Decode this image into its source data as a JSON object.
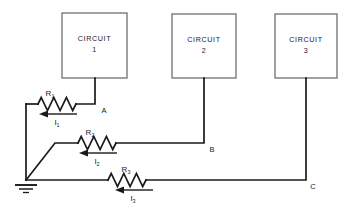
{
  "figure": {
    "type": "circuit-schematic",
    "background_color": "#ffffff",
    "wire_color": "#1a1a1a",
    "box_border_color": "#6a6a6a"
  },
  "blocks": [
    {
      "id": "circuit-1",
      "line1": "CIRCUIT",
      "line2": "1",
      "x": 62,
      "y": 13,
      "w": 65,
      "h": 65
    },
    {
      "id": "circuit-2",
      "line1": "CIRCUIT",
      "line2": "2",
      "x": 172,
      "y": 14,
      "w": 64,
      "h": 64
    },
    {
      "id": "circuit-3",
      "line1": "CIRCUIT",
      "line2": "3",
      "x": 275,
      "y": 14,
      "w": 62,
      "h": 64
    }
  ],
  "nodes": [
    {
      "id": "node-a",
      "label": "A",
      "x": 104,
      "y": 112
    },
    {
      "id": "node-b",
      "label": "B",
      "x": 212,
      "y": 151
    },
    {
      "id": "node-c",
      "label": "C",
      "x": 313,
      "y": 188
    }
  ],
  "resistors": [
    {
      "id": "r1",
      "label": "R",
      "subscript": "1",
      "label_x": 50,
      "label_y": 96,
      "zig_x": 38,
      "zig_y": 104,
      "zig_w": 38
    },
    {
      "id": "r2",
      "label": "R",
      "subscript": "2",
      "label_x": 90,
      "label_y": 135,
      "zig_x": 78,
      "zig_y": 143,
      "zig_w": 38
    },
    {
      "id": "r3",
      "label": "R",
      "subscript": "3",
      "label_x": 126,
      "label_y": 172,
      "zig_x": 108,
      "zig_y": 180,
      "zig_w": 38
    }
  ],
  "currents": [
    {
      "id": "i1",
      "label": "I",
      "subscript": "1",
      "label_x": 57,
      "label_y": 124,
      "arrow_y": 114,
      "arrow_from_x": 77,
      "arrow_to_x": 40,
      "direction": "left"
    },
    {
      "id": "i2",
      "label": "I",
      "subscript": "2",
      "label_x": 97,
      "label_y": 163,
      "arrow_y": 153,
      "arrow_from_x": 117,
      "arrow_to_x": 80,
      "direction": "left"
    },
    {
      "id": "i3",
      "label": "I",
      "subscript": "3",
      "label_x": 133,
      "label_y": 200,
      "arrow_y": 190,
      "arrow_from_x": 153,
      "arrow_to_x": 116,
      "direction": "left"
    }
  ],
  "ground": {
    "id": "ground-symbol",
    "x": 26,
    "y": 180,
    "label": "ground"
  }
}
